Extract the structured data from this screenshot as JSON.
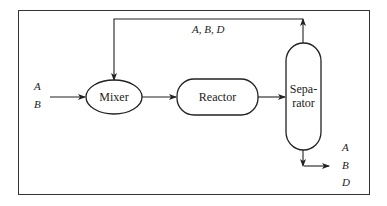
{
  "diagram": {
    "type": "process-flow",
    "nodes": [
      {
        "id": "mixer",
        "label": "Mixer",
        "shape": "ellipse"
      },
      {
        "id": "reactor",
        "label": "Reactor",
        "shape": "rounded-rectangle"
      },
      {
        "id": "separator",
        "label_line1": "Sepa-",
        "label_line2": "rator",
        "shape": "vertical-vessel"
      }
    ],
    "streams": {
      "feed": {
        "labels": [
          "A",
          "B"
        ]
      },
      "recycle": {
        "label": "A, B, D"
      },
      "product": {
        "labels": [
          "A",
          "B",
          "D"
        ]
      }
    },
    "edges": [
      {
        "from": "feed",
        "to": "mixer"
      },
      {
        "from": "mixer",
        "to": "reactor"
      },
      {
        "from": "reactor",
        "to": "separator"
      },
      {
        "from": "separator",
        "to": "mixer",
        "via": "recycle"
      },
      {
        "from": "separator",
        "to": "product"
      }
    ]
  }
}
